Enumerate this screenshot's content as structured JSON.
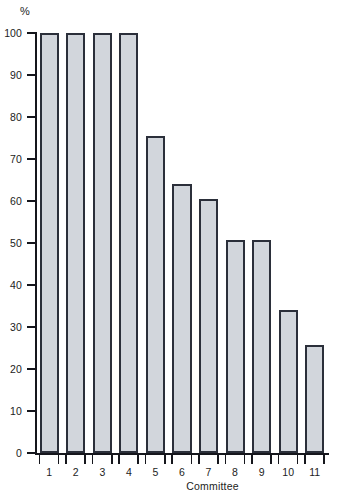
{
  "chart_data": {
    "type": "bar",
    "title": "",
    "subtitle": "",
    "xlabel": "Committee",
    "ylabel": "%",
    "unit_label": "%",
    "categories": [
      "1",
      "2",
      "3",
      "4",
      "5",
      "6",
      "7",
      "8",
      "9",
      "10",
      "11"
    ],
    "values": [
      100,
      100,
      100,
      100,
      75.5,
      64,
      60.5,
      50.8,
      50.8,
      34,
      25.7
    ],
    "series": [
      {
        "name": "Percent",
        "values": [
          100,
          100,
          100,
          100,
          75.5,
          64,
          60.5,
          50.8,
          50.8,
          34,
          25.7
        ]
      }
    ],
    "ylim": [
      0,
      100
    ],
    "xlim": [
      0,
      11
    ],
    "ytick_labels": [
      "0",
      "10",
      "20",
      "30",
      "40",
      "50",
      "60",
      "70",
      "80",
      "90",
      "100"
    ],
    "ytick_values": [
      0,
      10,
      20,
      30,
      40,
      50,
      60,
      70,
      80,
      90,
      100
    ],
    "grid": false,
    "legend": false,
    "legend_position": "none",
    "colors": {
      "bar_fill": "#d2d6dc",
      "bar_border": "#2b2f3a",
      "axis": "#15161c",
      "text": "#1c1c22",
      "background": "#ffffff"
    }
  }
}
